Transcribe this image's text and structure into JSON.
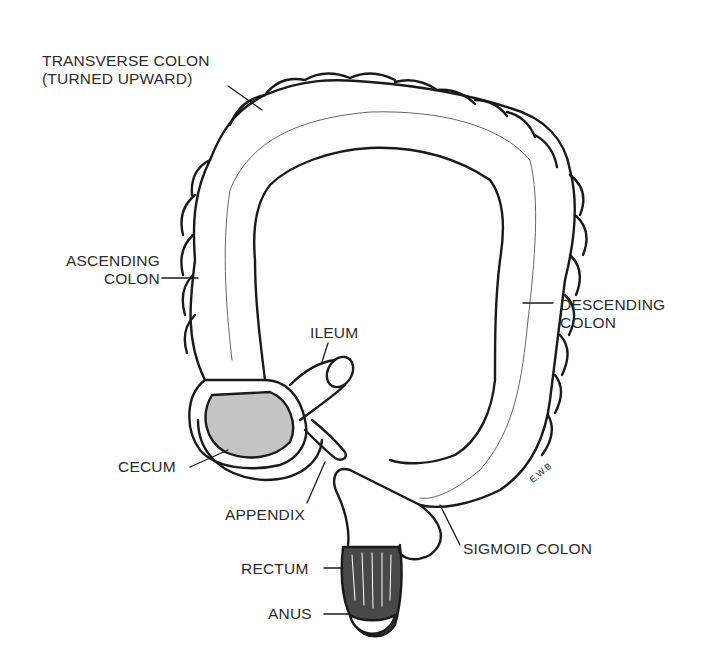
{
  "diagram": {
    "labels": {
      "transverse_1": "TRANSVERSE COLON",
      "transverse_2": "(TURNED UPWARD)",
      "ascending_1": "ASCENDING",
      "ascending_2": "COLON",
      "descending_1": "DESCENDING",
      "descending_2": "COLON",
      "ileum": "ILEUM",
      "cecum": "CECUM",
      "appendix": "APPENDIX",
      "sigmoid": "SIGMOID COLON",
      "rectum": "RECTUM",
      "anus": "ANUS"
    },
    "signature": "E.W.B",
    "colors": {
      "ink": "#1a1a1a",
      "label": "#2b2b2b",
      "background": "#ffffff",
      "shade": "#555555"
    }
  }
}
